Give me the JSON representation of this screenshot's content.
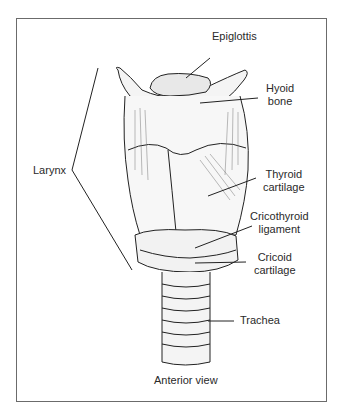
{
  "figure": {
    "caption": "Anterior view",
    "labels": {
      "epiglottis": "Epiglottis",
      "hyoid": [
        "Hyoid",
        "bone"
      ],
      "larynx": "Larynx",
      "thyroid": [
        "Thyroid",
        "cartilage"
      ],
      "cricothyroid": [
        "Cricothyroid",
        "ligament"
      ],
      "cricoid": [
        "Cricoid",
        "cartilage"
      ],
      "trachea": "Trachea"
    }
  }
}
